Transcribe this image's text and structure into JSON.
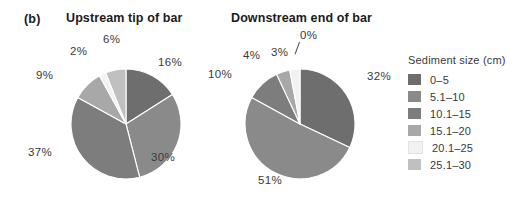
{
  "figure": {
    "panel_letter": "(b)",
    "background": "#ffffff"
  },
  "legend": {
    "title": "Sediment size (cm)",
    "items": [
      {
        "label": "0–5",
        "color": "#6e6e6e"
      },
      {
        "label": "5.1–10",
        "color": "#8a8a8a"
      },
      {
        "label": "10.1–15",
        "color": "#7d7d7d"
      },
      {
        "label": "15.1–20",
        "color": "#a8a8a8"
      },
      {
        "label": "20.1–25",
        "color": "#f2f2f2"
      },
      {
        "label": "25.1–30",
        "color": "#c0c0c0"
      }
    ]
  },
  "chart_data": [
    {
      "type": "pie",
      "title": "Upstream tip of bar",
      "legend_title": "Sediment size (cm)",
      "legend_position": "right",
      "categories": [
        "0–5",
        "5.1–10",
        "10.1–15",
        "15.1–20",
        "20.1–25",
        "25.1–30"
      ],
      "values": [
        16,
        30,
        37,
        9,
        2,
        6
      ],
      "value_labels": [
        "16%",
        "30%",
        "37%",
        "9%",
        "2%",
        "6%"
      ],
      "colors": [
        "#6e6e6e",
        "#8a8a8a",
        "#7d7d7d",
        "#a8a8a8",
        "#f2f2f2",
        "#c0c0c0"
      ],
      "units": "percent",
      "start_angle_deg": 0,
      "direction": "clockwise"
    },
    {
      "type": "pie",
      "title": "Downstream end of bar",
      "legend_title": "Sediment size (cm)",
      "legend_position": "right",
      "categories": [
        "0–5",
        "5.1–10",
        "10.1–15",
        "15.1–20",
        "20.1–25",
        "25.1–30"
      ],
      "values": [
        32,
        51,
        10,
        4,
        3,
        0
      ],
      "value_labels": [
        "32%",
        "51%",
        "10%",
        "4%",
        "3%",
        "0%"
      ],
      "colors": [
        "#6e6e6e",
        "#8a8a8a",
        "#7d7d7d",
        "#a8a8a8",
        "#f2f2f2",
        "#c0c0c0"
      ],
      "units": "percent",
      "start_angle_deg": 0,
      "direction": "clockwise"
    }
  ],
  "charts": [
    {
      "title": "Upstream tip of bar",
      "labels": [
        {
          "text": "16%",
          "left": 158,
          "top": 56
        },
        {
          "text": "30%",
          "left": 151,
          "top": 151
        },
        {
          "text": "37%",
          "left": 28,
          "top": 146
        },
        {
          "text": "9%",
          "left": 36,
          "top": 69
        },
        {
          "text": "2%",
          "left": 70,
          "top": 45
        },
        {
          "text": "6%",
          "left": 103,
          "top": 33
        }
      ]
    },
    {
      "title": "Downstream end of bar",
      "labels": [
        {
          "text": "32%",
          "left": 367,
          "top": 70
        },
        {
          "text": "51%",
          "left": 258,
          "top": 174
        },
        {
          "text": "10%",
          "left": 208,
          "top": 68
        },
        {
          "text": "4%",
          "left": 243,
          "top": 49
        },
        {
          "text": "3%",
          "left": 271,
          "top": 46
        },
        {
          "text": "0%",
          "left": 300,
          "top": 29
        }
      ]
    }
  ]
}
